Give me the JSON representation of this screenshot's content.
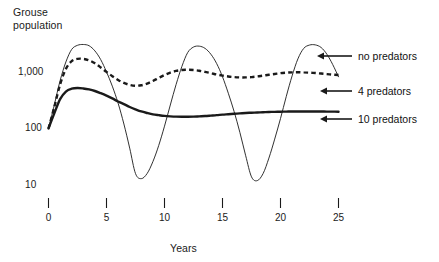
{
  "figure": {
    "width": 439,
    "height": 262,
    "background": "#ffffff",
    "ink": "#1a1a1a"
  },
  "axis": {
    "y_title_line1": "Grouse",
    "y_title_line2": "population",
    "x_title": "Years",
    "y_ticks": [
      "1,000",
      "100",
      "10"
    ],
    "x_ticks": [
      "0",
      "5",
      "10",
      "15",
      "20",
      "25"
    ]
  },
  "legend": {
    "items": [
      {
        "label": "no predators",
        "style": "thin-solid"
      },
      {
        "label": "4 predators",
        "style": "dashed"
      },
      {
        "label": "10 predators",
        "style": "thick-solid"
      }
    ]
  },
  "chart_data": {
    "type": "line",
    "title": "",
    "xlabel": "Years",
    "ylabel": "Grouse population",
    "yscale": "log",
    "ylim": [
      10,
      4000
    ],
    "xlim": [
      0,
      25
    ],
    "yticks": [
      10,
      100,
      1000
    ],
    "xticks": [
      0,
      5,
      10,
      15,
      20,
      25
    ],
    "grid": false,
    "legend_position": "right",
    "annotations": [
      "no predators",
      "4 predators",
      "10 predators"
    ],
    "series": [
      {
        "name": "no predators",
        "style": "thin solid line",
        "x": [
          0,
          0.5,
          1,
          1.5,
          2,
          2.5,
          3,
          3.5,
          4,
          4.5,
          5,
          5.5,
          6,
          6.5,
          7,
          7.5,
          8,
          8.5,
          9,
          9.5,
          10,
          10.5,
          11,
          11.5,
          12,
          12.5,
          13,
          13.5,
          14,
          14.5,
          15,
          15.5,
          16,
          16.5,
          17,
          17.5,
          18,
          18.5,
          19,
          19.5,
          20,
          20.5,
          21,
          21.5,
          22,
          22.5,
          23,
          23.5,
          24,
          24.5,
          25
        ],
        "y": [
          100,
          260,
          700,
          1500,
          2500,
          2950,
          3050,
          2900,
          2350,
          1650,
          1000,
          560,
          280,
          120,
          45,
          16,
          13,
          16,
          26,
          50,
          110,
          260,
          600,
          1250,
          2200,
          2750,
          2850,
          2600,
          2050,
          1400,
          820,
          420,
          200,
          85,
          33,
          14,
          12,
          16,
          30,
          65,
          150,
          370,
          850,
          1700,
          2600,
          2980,
          3000,
          2700,
          2050,
          1350,
          820
        ]
      },
      {
        "name": "4 predators",
        "style": "dashed line",
        "x": [
          0,
          0.5,
          1,
          1.5,
          2,
          2.5,
          3,
          3.5,
          4,
          4.5,
          5,
          5.5,
          6,
          6.5,
          7,
          7.5,
          8,
          8.5,
          9,
          9.5,
          10,
          10.5,
          11,
          11.5,
          12,
          12.5,
          13,
          13.5,
          14,
          14.5,
          15,
          15.5,
          16,
          16.5,
          17,
          17.5,
          18,
          18.5,
          19,
          19.5,
          20,
          20.5,
          21,
          21.5,
          22,
          22.5,
          23,
          23.5,
          24,
          24.5,
          25
        ],
        "y": [
          100,
          240,
          600,
          1130,
          1550,
          1700,
          1700,
          1600,
          1420,
          1200,
          1000,
          840,
          720,
          640,
          590,
          570,
          580,
          620,
          690,
          780,
          880,
          970,
          1040,
          1080,
          1090,
          1080,
          1050,
          1000,
          950,
          900,
          860,
          830,
          810,
          800,
          800,
          810,
          830,
          860,
          890,
          920,
          950,
          970,
          980,
          985,
          980,
          970,
          955,
          935,
          915,
          895,
          880
        ]
      },
      {
        "name": "10 predators",
        "style": "thick solid line",
        "x": [
          0,
          0.5,
          1,
          1.5,
          2,
          2.5,
          3,
          3.5,
          4,
          4.5,
          5,
          5.5,
          6,
          6.5,
          7,
          7.5,
          8,
          8.5,
          9,
          9.5,
          10,
          10.5,
          11,
          11.5,
          12,
          12.5,
          13,
          13.5,
          14,
          14.5,
          15,
          15.5,
          16,
          16.5,
          17,
          17.5,
          18,
          18.5,
          19,
          19.5,
          20,
          20.5,
          21,
          21.5,
          22,
          22.5,
          23,
          23.5,
          24,
          24.5,
          25
        ],
        "y": [
          100,
          185,
          330,
          450,
          505,
          520,
          510,
          490,
          460,
          420,
          380,
          340,
          300,
          270,
          240,
          218,
          200,
          188,
          178,
          172,
          167,
          164,
          162,
          161,
          161,
          162,
          164,
          166,
          169,
          172,
          176,
          179,
          182,
          185,
          188,
          190,
          192,
          194,
          196,
          197,
          198,
          199,
          200,
          200,
          200,
          200,
          200,
          200,
          199,
          199,
          198
        ]
      }
    ]
  }
}
